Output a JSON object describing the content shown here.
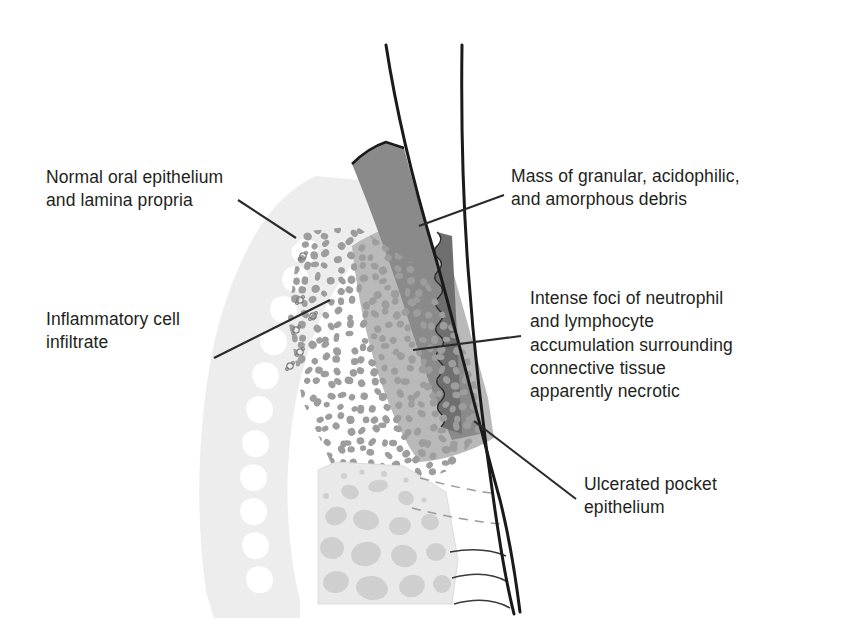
{
  "figure": {
    "type": "medical-illustration",
    "width": 843,
    "height": 628,
    "background_color": "#ffffff"
  },
  "labels": {
    "normal_epithelium": "Normal oral epithelium\nand lamina propria",
    "inflammatory_infiltrate": "Inflammatory cell\ninfiltrate",
    "debris_mass": "Mass of granular, acidophilic,\nand amorphous debris",
    "intense_foci": "Intense foci of neutrophil\nand lymphocyte\naccumulation surrounding\nconnective tissue\napparently necrotic",
    "ulcerated_pocket": "Ulcerated pocket\nepithelium"
  },
  "structures": [
    {
      "name": "tooth-crown-outline",
      "description": "Two black converging curves representing tooth surface",
      "color": "#1a1a1a"
    },
    {
      "name": "debris-mass",
      "description": "Dark grey wedge of granular acidophilic amorphous debris in pocket",
      "color": "#8a8a8a"
    },
    {
      "name": "gingival-connective-tissue",
      "description": "Very light grey lamina propria with rete ridges",
      "color": "#ededed"
    },
    {
      "name": "necrotic-connective-tissue",
      "description": "Mid grey zone of necrotic connective tissue",
      "color": "#b9b9b9"
    },
    {
      "name": "ulcerated-pocket-epithelium",
      "description": "Scalloped darker grey strip lining the tooth",
      "color": "#6f6f6f"
    },
    {
      "name": "inflammatory-cell-dots",
      "description": "Dense field of grey round inflammatory cells",
      "color": "#9d9d9d"
    },
    {
      "name": "alveolar-bone",
      "description": "Trabecular bone with marrow spaces",
      "color": "#e2e2e2"
    },
    {
      "name": "periodontal-ligament-fibers",
      "description": "Dashed and solid thin curves between bone and root",
      "color": "#9a9a9a"
    }
  ],
  "colors": {
    "text": "#231f20",
    "leader_line": "#2a2a2a",
    "outline_black": "#1a1a1a",
    "debris_grey": "#8a8a8a",
    "tissue_light": "#ededed",
    "tissue_mid": "#b9b9b9",
    "cell_dot": "#9d9d9d",
    "bone": "#e2e2e2"
  },
  "leader_lines": [
    {
      "name": "leader-normal-epithelium",
      "from": [
        238,
        200
      ],
      "to": [
        296,
        238
      ]
    },
    {
      "name": "leader-inflammatory-infiltrate",
      "from": [
        214,
        358
      ],
      "to": [
        330,
        300
      ]
    },
    {
      "name": "leader-debris-mass",
      "from": [
        504,
        195
      ],
      "to": [
        419,
        226
      ]
    },
    {
      "name": "leader-intense-foci",
      "from": [
        521,
        336
      ],
      "to": [
        413,
        350
      ]
    },
    {
      "name": "leader-ulcerated-pocket",
      "from": [
        576,
        499
      ],
      "to": [
        474,
        421
      ]
    }
  ]
}
